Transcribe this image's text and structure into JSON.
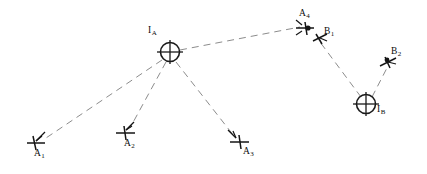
{
  "diagram": {
    "background_color": "#ffffff",
    "line_color": "#8c8c8c",
    "symbol_color": "#151515",
    "line_style": "dashed",
    "nodes": [
      {
        "id": "IA",
        "label": "I",
        "subscript": "A",
        "symbol": "circled-crosshair",
        "x": 170,
        "y": 52,
        "label_x": 148,
        "label_y": 30
      },
      {
        "id": "IB",
        "label": "I",
        "subscript": "B",
        "symbol": "circled-crosshair",
        "x": 366,
        "y": 104,
        "label_x": 376,
        "label_y": 110
      },
      {
        "id": "A1",
        "label": "A",
        "subscript": "1",
        "symbol": "aircraft",
        "x": 38,
        "y": 142,
        "label_x": 35,
        "label_y": 148
      },
      {
        "id": "A2",
        "label": "A",
        "subscript": "2",
        "symbol": "aircraft",
        "x": 126,
        "y": 132,
        "label_x": 124,
        "label_y": 139
      },
      {
        "id": "A3",
        "label": "A",
        "subscript": "3",
        "symbol": "aircraft",
        "x": 239,
        "y": 141,
        "label_x": 241,
        "label_y": 146
      },
      {
        "id": "A4",
        "label": "A",
        "subscript": "4",
        "symbol": "aircraft",
        "x": 305,
        "y": 28,
        "label_x": 300,
        "label_y": 10
      },
      {
        "id": "B1",
        "label": "B",
        "subscript": "1",
        "symbol": "aircraft",
        "x": 319,
        "y": 37,
        "label_x": 322,
        "label_y": 29
      },
      {
        "id": "B2",
        "label": "B",
        "subscript": "2",
        "symbol": "aircraft",
        "x": 388,
        "y": 62,
        "label_x": 391,
        "label_y": 49
      }
    ],
    "links": [
      {
        "id": "IA-A1",
        "from": "IA",
        "to": "A1"
      },
      {
        "id": "IA-A2",
        "from": "IA",
        "to": "A2"
      },
      {
        "id": "IA-A3",
        "from": "IA",
        "to": "A3"
      },
      {
        "id": "IA-A4",
        "from": "IA",
        "to": "A4"
      },
      {
        "id": "IB-B1",
        "from": "IB",
        "to": "B1"
      },
      {
        "id": "IB-B2",
        "from": "IB",
        "to": "B2"
      }
    ]
  }
}
